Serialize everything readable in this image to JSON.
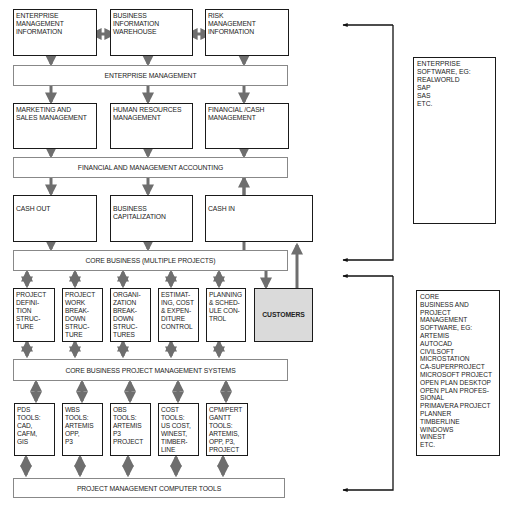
{
  "diagram": {
    "row1": [
      {
        "id": "enterprise-management-information",
        "lines": [
          "ENTERPRISE",
          "MANAGEMENT",
          "INFORMATION"
        ]
      },
      {
        "id": "business-information-warehouse",
        "lines": [
          "BUSINESS",
          "INFORMATION",
          "WAREHOUSE"
        ]
      },
      {
        "id": "risk-management-information",
        "lines": [
          "RISK",
          "MANAGEMENT",
          "INFORMATION"
        ]
      }
    ],
    "band1": "ENTERPRISE MANAGEMENT",
    "row2": [
      {
        "id": "marketing-and-sales-management",
        "lines": [
          "MARKETING AND",
          "SALES MANAGEMENT"
        ]
      },
      {
        "id": "human-resources-management",
        "lines": [
          "HUMAN RESOURCES",
          "MANAGEMENT"
        ]
      },
      {
        "id": "financial-cash-management",
        "lines": [
          "FINANCIAL /CASH",
          "MANAGEMENT"
        ]
      }
    ],
    "band2": "FINANCIAL AND MANAGEMENT ACCOUNTING",
    "row3": [
      {
        "id": "cash-out",
        "lines": [
          "CASH OUT"
        ]
      },
      {
        "id": "business-capitalization",
        "lines": [
          "BUSINESS",
          "CAPITALIZATION"
        ]
      },
      {
        "id": "cash-in",
        "lines": [
          "CASH IN"
        ]
      }
    ],
    "band3": "CORE BUSINESS (MULTIPLE PROJECTS)",
    "row4": [
      {
        "id": "project-definition-structure",
        "lines": [
          "PROJECT",
          "DEFINI-",
          "TION",
          "STRUC-",
          "TURE"
        ]
      },
      {
        "id": "project-work-breakdown-structure",
        "lines": [
          "PROJECT",
          "WORK",
          "BREAK-",
          "DOWN",
          "STRUC-",
          "TURE"
        ]
      },
      {
        "id": "organization-breakdown-structures",
        "lines": [
          "ORGANI-",
          "ZATION",
          "BREAK-",
          "DOWN",
          "STRUC-",
          "TURES"
        ]
      },
      {
        "id": "estimating-cost-expenditure-control",
        "lines": [
          "ESTIMAT-",
          "ING,  COST",
          "& EXPEN-",
          "DITURE",
          "CONTROL"
        ]
      },
      {
        "id": "planning-schedule-control",
        "lines": [
          "PLANNING",
          "& SCHED-",
          "ULE CON-",
          "TROL"
        ]
      }
    ],
    "customers": "CUSTOMERS",
    "band4": "CORE BUSINESS PROJECT MANAGEMENT SYSTEMS",
    "row5": [
      {
        "id": "pds-tools",
        "lines": [
          "PDS",
          "TOOLS:",
          "CAD,",
          "CAFM,",
          "GIS"
        ]
      },
      {
        "id": "wbs-tools",
        "lines": [
          "WBS",
          "TOOLS:",
          "ARTEMIS",
          "OPP,",
          "P3"
        ]
      },
      {
        "id": "obs-tools",
        "lines": [
          "OBS",
          "TOOLS:",
          "ARTEMIS",
          "P3",
          "PROJECT"
        ]
      },
      {
        "id": "cost-tools",
        "lines": [
          "COST",
          "TOOLS:",
          "US COST,",
          "WINEST,",
          "TIMBER-",
          "LINE"
        ]
      },
      {
        "id": "cpm-pert-gantt-tools",
        "lines": [
          "CPM/PERT",
          "GANTT",
          "TOOLS:",
          "ARTEMIS,",
          "OPP, P3,",
          "PROJECT"
        ]
      }
    ],
    "band5": "PROJECT MANAGEMENT COMPUTER TOOLS",
    "enterprise_software": [
      "ENTERPRISE",
      "SOFTWARE, EG:",
      "REALWORLD",
      "SAP",
      "SAS",
      "ETC."
    ],
    "core_software": [
      "CORE",
      "BUSINESS AND",
      "PROJECT",
      "MANAGEMENT",
      "SOFTWARE, EG:",
      "ARTEMIS",
      "AUTOCAD",
      "CIVILSOFT",
      "MICROSTATION",
      "CA-SUPERPROJECT",
      "MICROSOFT PROJECT",
      "OPEN PLAN DESKTOP",
      "OPEN PLAN PROFES-",
      "SIONAL",
      "PRIMAVERA PROJECT",
      "PLANNER",
      "TIMBERLINE",
      "WINDOWS",
      "WINEST",
      "ETC."
    ],
    "colors": {
      "box_border": "#1a1a1a",
      "band_border": "#888888",
      "arrow": "#6e6e6e",
      "customers_fill": "#dadada",
      "bracket": "#1a1a1a"
    }
  }
}
